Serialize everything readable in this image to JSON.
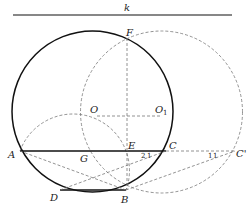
{
  "diagram": {
    "line_label": "k",
    "points": {
      "F": "F",
      "O": "O",
      "O1": "O",
      "O1_sub": "1",
      "A": "A",
      "G": "G",
      "E": "E",
      "C": "C",
      "C_prime": "C'",
      "D": "D",
      "B": "B"
    },
    "angle_labels": {
      "at_C_2": "2",
      "at_C_1": "1",
      "at_Cp_1a": "1",
      "at_Cp_1b": "1"
    },
    "colors": {
      "solid": "#111111",
      "dashed": "#777777"
    }
  }
}
